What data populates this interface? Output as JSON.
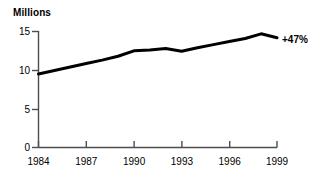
{
  "chart_data": {
    "type": "line",
    "title": "Millions",
    "xlabel": "",
    "ylabel": "Millions",
    "x": [
      1984,
      1985,
      1986,
      1987,
      1988,
      1989,
      1990,
      1991,
      1992,
      1993,
      1994,
      1995,
      1996,
      1997,
      1998,
      1999
    ],
    "values": [
      9.5,
      9.95,
      10.4,
      10.85,
      11.3,
      11.8,
      12.5,
      12.6,
      12.8,
      12.45,
      12.9,
      13.3,
      13.7,
      14.1,
      14.7,
      14.2
    ],
    "series": [
      {
        "name": "Millions",
        "values": [
          9.5,
          9.95,
          10.4,
          10.85,
          11.3,
          11.8,
          12.5,
          12.6,
          12.8,
          12.45,
          12.9,
          13.3,
          13.7,
          14.1,
          14.7,
          14.2
        ],
        "color": "#000000"
      }
    ],
    "xlim": [
      1984,
      1999
    ],
    "ylim": [
      0,
      15
    ],
    "xticks": [
      1984,
      1987,
      1990,
      1993,
      1996,
      1999
    ],
    "xtick_labels": [
      "1984",
      "1987",
      "1990",
      "1993",
      "1996",
      "1999"
    ],
    "yticks": [
      0,
      5,
      10,
      15
    ],
    "ytick_labels": [
      "0",
      "5",
      "10",
      "15"
    ],
    "grid": false,
    "legend": false,
    "annotations": [
      {
        "text": "+47%",
        "x": 1999,
        "y": 14.2,
        "color": "#000000"
      }
    ],
    "line_color": "#000000",
    "axis_color": "#4d4d4d",
    "background": "#ffffff"
  },
  "labels": {
    "y_axis_title": "Millions",
    "growth_annotation": "+47%",
    "y_0": "0",
    "y_5": "5",
    "y_10": "10",
    "y_15": "15",
    "x_1984": "1984",
    "x_1987": "1987",
    "x_1990": "1990",
    "x_1993": "1993",
    "x_1996": "1996",
    "x_1999": "1999"
  }
}
